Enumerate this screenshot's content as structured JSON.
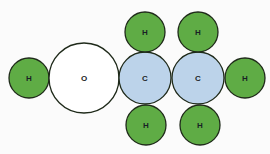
{
  "diagram": {
    "title": "",
    "colors": {
      "hydrogen": "#5fac45",
      "oxygen": "#ffffff",
      "carbon": "#bcd3ea",
      "stroke": "#1f2a1a",
      "label": "#1a1f26"
    },
    "atoms": [
      {
        "id": "h-left",
        "element": "H",
        "label": "H",
        "cx": 29,
        "cy": 78,
        "r": 20
      },
      {
        "id": "o",
        "element": "O",
        "label": "O",
        "cx": 84,
        "cy": 78,
        "r": 35
      },
      {
        "id": "c1",
        "element": "C",
        "label": "C",
        "cx": 145,
        "cy": 78,
        "r": 26
      },
      {
        "id": "c2",
        "element": "C",
        "label": "C",
        "cx": 198,
        "cy": 78,
        "r": 26
      },
      {
        "id": "h-right",
        "element": "H",
        "label": "H",
        "cx": 245,
        "cy": 78,
        "r": 20
      },
      {
        "id": "h-c1-top",
        "element": "H",
        "label": "H",
        "cx": 145,
        "cy": 32,
        "r": 20
      },
      {
        "id": "h-c2-top",
        "element": "H",
        "label": "H",
        "cx": 198,
        "cy": 32,
        "r": 20
      },
      {
        "id": "h-c1-bottom",
        "element": "H",
        "label": "H",
        "cx": 146,
        "cy": 125,
        "r": 20
      },
      {
        "id": "h-c2-bottom",
        "element": "H",
        "label": "H",
        "cx": 200,
        "cy": 125,
        "r": 20
      }
    ]
  }
}
